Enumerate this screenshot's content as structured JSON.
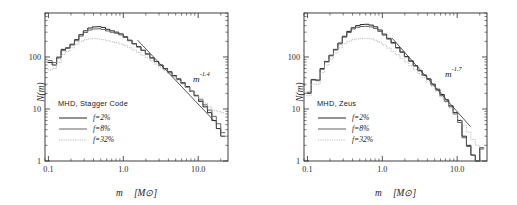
{
  "figure": {
    "background": "#ffffff",
    "panel_count": 2
  },
  "chart_data": [
    {
      "type": "line",
      "panel": "left",
      "title": "",
      "legend_title": "MHD, Stagger Code",
      "legend_position": "center-left",
      "xlabel": "m [M⊙]",
      "ylabel": "N(m)",
      "xscale": "log",
      "yscale": "log",
      "xlim": [
        0.09,
        25
      ],
      "ylim": [
        1,
        700
      ],
      "xticks": [
        0.1,
        1.0,
        10.0
      ],
      "xticklabels": [
        "0.1",
        "1.0",
        "10.0"
      ],
      "yticks": [
        1,
        10,
        100
      ],
      "yticklabels": [
        "1",
        "10",
        "100"
      ],
      "grid": false,
      "annotation": {
        "base": "m",
        "exponent": "-1.4",
        "text": "m^-1.4",
        "x": 5.5,
        "y": 42
      },
      "fit_line": {
        "slope": -1.4,
        "x_start": 1.55,
        "x_end": 16.5,
        "y_start": 210,
        "y_end": 5.8
      },
      "series": [
        {
          "name": "f=2%",
          "color": "#262626",
          "style": "solid",
          "x": [
            0.105,
            0.12,
            0.138,
            0.158,
            0.181,
            0.208,
            0.238,
            0.273,
            0.313,
            0.359,
            0.411,
            0.471,
            0.54,
            0.619,
            0.709,
            0.813,
            0.931,
            1.067,
            1.223,
            1.402,
            1.607,
            1.841,
            2.11,
            2.418,
            2.771,
            3.176,
            3.64,
            4.171,
            4.78,
            5.478,
            6.278,
            7.194,
            8.245,
            9.448,
            10.83,
            12.41,
            14.22,
            16.3,
            18.68,
            21.41
          ],
          "values": [
            78,
            70,
            96,
            140,
            150,
            176,
            215,
            268,
            318,
            360,
            378,
            382,
            370,
            340,
            318,
            300,
            278,
            245,
            210,
            180,
            158,
            135,
            115,
            96,
            82,
            70,
            60,
            52,
            44,
            38,
            32,
            27,
            22,
            18,
            14,
            11,
            8.5,
            6.0,
            4.2,
            3.0
          ]
        },
        {
          "name": "f=8%",
          "color": "#5c5c5c",
          "style": "solid",
          "x": [
            0.105,
            0.12,
            0.138,
            0.158,
            0.181,
            0.208,
            0.238,
            0.273,
            0.313,
            0.359,
            0.411,
            0.471,
            0.54,
            0.619,
            0.709,
            0.813,
            0.931,
            1.067,
            1.223,
            1.402,
            1.607,
            1.841,
            2.11,
            2.418,
            2.771,
            3.176,
            3.64,
            4.171,
            4.78,
            5.478,
            6.278,
            7.194,
            8.245,
            9.448,
            10.83,
            12.41,
            14.22,
            16.3,
            18.68,
            21.41
          ],
          "values": [
            85,
            78,
            100,
            132,
            146,
            170,
            205,
            252,
            295,
            330,
            345,
            348,
            338,
            316,
            298,
            285,
            265,
            236,
            205,
            178,
            155,
            133,
            113,
            95,
            81,
            69,
            59,
            51,
            43,
            37,
            31,
            26,
            22,
            18,
            15,
            12,
            9.5,
            7.2,
            5.2,
            3.5
          ]
        },
        {
          "name": "f=32%",
          "color": "#b4b4b4",
          "style": "dotted",
          "x": [
            0.105,
            0.12,
            0.138,
            0.158,
            0.181,
            0.208,
            0.238,
            0.273,
            0.313,
            0.359,
            0.411,
            0.471,
            0.54,
            0.619,
            0.709,
            0.813,
            0.931,
            1.067,
            1.223,
            1.402,
            1.607,
            1.841,
            2.11,
            2.418,
            2.771,
            3.176,
            3.64,
            4.171,
            4.78,
            5.478,
            6.278,
            7.194,
            8.245,
            9.448,
            10.83,
            12.41,
            14.22,
            16.3,
            18.68,
            21.41
          ],
          "values": [
            56,
            60,
            78,
            112,
            128,
            150,
            175,
            200,
            215,
            222,
            225,
            222,
            215,
            205,
            196,
            188,
            178,
            165,
            150,
            135,
            122,
            108,
            96,
            84,
            73,
            63,
            55,
            48,
            41,
            35,
            30,
            26,
            22,
            19,
            16,
            13,
            11,
            9.5,
            9.0,
            8.5
          ]
        }
      ]
    },
    {
      "type": "line",
      "panel": "right",
      "title": "",
      "legend_title": "MHD, Zeus",
      "legend_position": "center-left",
      "xlabel": "m [M⊙]",
      "ylabel": "N(m)",
      "xscale": "log",
      "yscale": "log",
      "xlim": [
        0.09,
        25
      ],
      "ylim": [
        1,
        700
      ],
      "xticks": [
        0.1,
        1.0,
        10.0
      ],
      "xticklabels": [
        "0.1",
        "1.0",
        "10.0"
      ],
      "yticks": [
        1,
        10,
        100
      ],
      "yticklabels": [
        "1",
        "10",
        "100"
      ],
      "grid": false,
      "annotation": {
        "base": "m",
        "exponent": "-1.7",
        "text": "m^-1.7",
        "x": 6.2,
        "y": 33
      },
      "fit_line": {
        "slope": -1.7,
        "x_start": 1.35,
        "x_end": 15.0,
        "y_start": 230,
        "y_end": 4.6
      },
      "series": [
        {
          "name": "f=2%",
          "color": "#262626",
          "style": "solid",
          "x": [
            0.105,
            0.12,
            0.138,
            0.158,
            0.181,
            0.208,
            0.238,
            0.273,
            0.313,
            0.359,
            0.411,
            0.471,
            0.54,
            0.619,
            0.709,
            0.813,
            0.931,
            1.067,
            1.223,
            1.402,
            1.607,
            1.841,
            2.11,
            2.418,
            2.771,
            3.176,
            3.64,
            4.171,
            4.78,
            5.478,
            6.278,
            7.194,
            8.245,
            9.448,
            10.83,
            12.41,
            14.22,
            16.3,
            18.68,
            21.41
          ],
          "values": [
            20,
            37,
            36,
            60,
            82,
            108,
            140,
            185,
            250,
            310,
            365,
            400,
            420,
            425,
            410,
            380,
            330,
            275,
            228,
            190,
            152,
            125,
            102,
            84,
            68,
            55,
            45,
            38,
            30,
            24,
            19,
            15,
            11.5,
            8.5,
            6.0,
            3.0,
            2.0,
            1.3,
            1.0,
            1.8
          ]
        },
        {
          "name": "f=8%",
          "color": "#5c5c5c",
          "style": "solid",
          "x": [
            0.105,
            0.12,
            0.138,
            0.158,
            0.181,
            0.208,
            0.238,
            0.273,
            0.313,
            0.359,
            0.411,
            0.471,
            0.54,
            0.619,
            0.709,
            0.813,
            0.931,
            1.067,
            1.223,
            1.402,
            1.607,
            1.841,
            2.11,
            2.418,
            2.771,
            3.176,
            3.64,
            4.171,
            4.78,
            5.478,
            6.278,
            7.194,
            8.245,
            9.448,
            10.83,
            12.41,
            14.22,
            16.3,
            18.68,
            21.41
          ],
          "values": [
            21,
            36,
            35,
            58,
            80,
            105,
            136,
            178,
            240,
            295,
            345,
            372,
            385,
            388,
            378,
            352,
            310,
            262,
            220,
            184,
            148,
            122,
            100,
            82,
            67,
            54,
            44,
            37,
            29,
            23,
            18,
            14,
            11,
            8.0,
            5.5,
            2.8,
            1.9,
            1.3,
            1.0,
            1.7
          ]
        },
        {
          "name": "f=32%",
          "color": "#b4b4b4",
          "style": "dotted",
          "x": [
            0.105,
            0.12,
            0.138,
            0.158,
            0.181,
            0.208,
            0.238,
            0.273,
            0.313,
            0.359,
            0.411,
            0.471,
            0.54,
            0.619,
            0.709,
            0.813,
            0.931,
            1.067,
            1.223,
            1.402,
            1.607,
            1.841,
            2.11,
            2.418,
            2.771,
            3.176,
            3.64,
            4.171,
            4.78,
            5.478,
            6.278,
            7.194,
            8.245,
            9.448,
            10.83,
            12.41,
            14.22,
            16.3,
            18.68,
            21.41
          ],
          "values": [
            18,
            30,
            30,
            50,
            70,
            92,
            118,
            150,
            180,
            200,
            215,
            222,
            228,
            228,
            222,
            210,
            192,
            170,
            148,
            128,
            110,
            94,
            80,
            68,
            57,
            48,
            40,
            33,
            27,
            22,
            17,
            13.5,
            10.5,
            8.0,
            6.2,
            4.8,
            3.6,
            2.6,
            2.0,
            1.8
          ]
        }
      ]
    }
  ],
  "panels": [
    {
      "id": "left",
      "legend": {
        "title": "MHD, Stagger Code",
        "entries": [
          {
            "label": "f=2%",
            "swatch": "solid-dark"
          },
          {
            "label": "f=8%",
            "swatch": "solid-gray"
          },
          {
            "label": "f=32%",
            "swatch": "dotted-light"
          }
        ]
      },
      "axes": {
        "xlabel_var": "m",
        "xlabel_unit": "[M⊙]",
        "ylabel": "N(m)",
        "xticklabels": [
          "0.1",
          "1.0",
          "10.0"
        ],
        "yticklabels": [
          "100",
          "10",
          "1"
        ]
      },
      "powerlaw": {
        "base": "m",
        "exponent": "-1.4"
      }
    },
    {
      "id": "right",
      "legend": {
        "title": "MHD, Zeus",
        "entries": [
          {
            "label": "f=2%",
            "swatch": "solid-dark"
          },
          {
            "label": "f=8%",
            "swatch": "solid-gray"
          },
          {
            "label": "f=32%",
            "swatch": "dotted-light"
          }
        ]
      },
      "axes": {
        "xlabel_var": "m",
        "xlabel_unit": "[M⊙]",
        "ylabel": "N(m)",
        "xticklabels": [
          "0.1",
          "1.0",
          "10.0"
        ],
        "yticklabels": [
          "100",
          "10",
          "1"
        ]
      },
      "powerlaw": {
        "base": "m",
        "exponent": "-1.7"
      }
    }
  ],
  "colors": {
    "background": "#ffffff",
    "axis": "#2b2b2b",
    "f2": "#262626",
    "f8": "#5c5c5c",
    "f32": "#b4b4b4",
    "fit": "#3a3a3a"
  }
}
